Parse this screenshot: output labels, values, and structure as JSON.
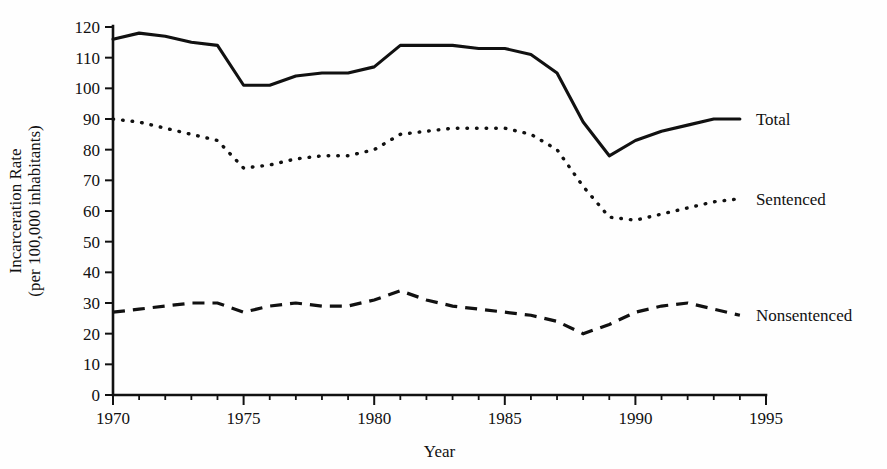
{
  "chart_data": {
    "type": "line",
    "title": "",
    "xlabel": "Year",
    "ylabel": "Incarceration Rate (per 100,000 inhabitants)",
    "ylabel_line1": "Incarceration Rate",
    "ylabel_line2": "(per 100,000 inhabitants)",
    "xlim": [
      1970,
      1995
    ],
    "ylim": [
      0,
      120
    ],
    "grid": false,
    "legend_position": "right-inline",
    "x_tick_labels": [
      "1970",
      "1975",
      "1980",
      "1985",
      "1990",
      "1995"
    ],
    "x_tick_values": [
      1970,
      1975,
      1980,
      1985,
      1990,
      1995
    ],
    "x_minor_step": 1,
    "y_tick_labels": [
      "0",
      "10",
      "20",
      "30",
      "40",
      "50",
      "60",
      "70",
      "80",
      "90",
      "100",
      "110",
      "120"
    ],
    "y_tick_values": [
      0,
      10,
      20,
      30,
      40,
      50,
      60,
      70,
      80,
      90,
      100,
      110,
      120
    ],
    "x": [
      1970,
      1971,
      1972,
      1973,
      1974,
      1975,
      1976,
      1977,
      1978,
      1979,
      1980,
      1981,
      1982,
      1983,
      1984,
      1985,
      1986,
      1987,
      1988,
      1989,
      1990,
      1991,
      1992,
      1993,
      1994
    ],
    "series": [
      {
        "name": "Total",
        "style": "solid",
        "label": "Total",
        "values": [
          116,
          118,
          117,
          115,
          114,
          101,
          101,
          104,
          105,
          105,
          107,
          114,
          114,
          114,
          113,
          113,
          111,
          105,
          89,
          78,
          83,
          86,
          88,
          90,
          90
        ]
      },
      {
        "name": "Sentenced",
        "style": "dotted",
        "label": "Sentenced",
        "values": [
          90,
          89,
          87,
          85,
          83,
          74,
          75,
          77,
          78,
          78,
          80,
          85,
          86,
          87,
          87,
          87,
          85,
          80,
          68,
          58,
          57,
          59,
          61,
          63,
          64
        ]
      },
      {
        "name": "Nonsentenced",
        "style": "dashed",
        "label": "Nonsentenced",
        "values": [
          27,
          28,
          29,
          30,
          30,
          27,
          29,
          30,
          29,
          29,
          31,
          34,
          31,
          29,
          28,
          27,
          26,
          24,
          20,
          23,
          27,
          29,
          30,
          28,
          26
        ]
      }
    ]
  }
}
